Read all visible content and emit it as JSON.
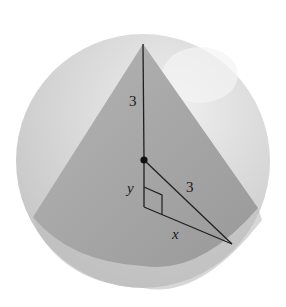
{
  "figure": {
    "labels": {
      "apex_segment": "3",
      "slant_radius": "3",
      "leg_vertical": "y",
      "leg_horizontal": "x"
    },
    "colors": {
      "sphere_outer": "#d4d4d4",
      "sphere_highlight": "#ececec",
      "cone_fill": "#a5a5a5",
      "cone_base": "#9a9a9a",
      "lines": "#1f1f1f"
    },
    "sphere": {
      "cx": 143,
      "cy": 161,
      "r": 127
    },
    "cone": {
      "apex": [
        143,
        44
      ],
      "base_left": [
        33,
        217
      ],
      "base_right": [
        258,
        208
      ]
    },
    "points": {
      "center": [
        144,
        160
      ],
      "right_angle_vertex": [
        144,
        207
      ],
      "base_point": [
        232,
        244
      ]
    }
  }
}
